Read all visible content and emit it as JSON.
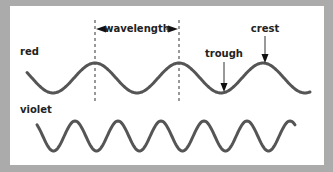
{
  "diagram": {
    "labels": {
      "red": "red",
      "violet": "violet",
      "wavelength": "wavelength",
      "trough": "trough",
      "crest": "crest"
    },
    "colors": {
      "frame": "#ababab",
      "panel": "#ffffff",
      "wave": "#555555",
      "text": "#222222"
    },
    "waves": [
      {
        "name": "red",
        "wavelength_px": 84,
        "amplitude_px": 15
      },
      {
        "name": "violet",
        "wavelength_px": 43,
        "amplitude_px": 15
      }
    ]
  }
}
